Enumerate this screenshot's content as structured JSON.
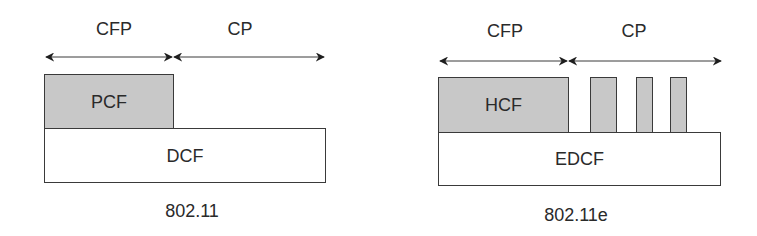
{
  "colors": {
    "shaded_fill": "#c8c8c8",
    "plain_fill": "#ffffff",
    "stroke": "#3a3a3a",
    "text": "#2a2a2a"
  },
  "diagrams": [
    {
      "caption": "802.11",
      "periods": [
        {
          "label": "CFP",
          "x_start": 45,
          "x_end": 173
        },
        {
          "label": "CP",
          "x_start": 173,
          "x_end": 325
        }
      ],
      "upper_box": {
        "label": "PCF",
        "shaded": true
      },
      "lower_box": {
        "label": "DCF",
        "shaded": false
      }
    },
    {
      "caption": "802.11e",
      "periods": [
        {
          "label": "CFP",
          "x_start": 439,
          "x_end": 568
        },
        {
          "label": "CP",
          "x_start": 568,
          "x_end": 722
        }
      ],
      "upper_box": {
        "label": "HCF",
        "shaded": true
      },
      "cp_bursts": 3,
      "lower_box": {
        "label": "EDCF",
        "shaded": false
      }
    }
  ]
}
